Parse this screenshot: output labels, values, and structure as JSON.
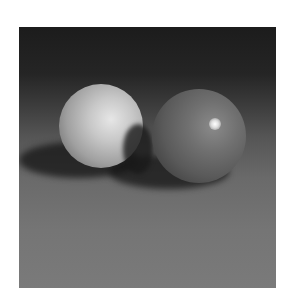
{
  "image": {
    "description": "Rendered scene of two spheres resting on a plane, casting shadows",
    "type": "grayscale rendering",
    "objects": [
      {
        "name": "left-sphere",
        "shade": "light gray",
        "matte": true
      },
      {
        "name": "right-sphere",
        "shade": "medium gray",
        "specular_highlight": true
      }
    ],
    "colors": {
      "background_top": "#1c1c1c",
      "floor": "#757575",
      "left_sphere": "#c8c8c8",
      "right_sphere": "#6a6a6a",
      "highlight": "#ffffff",
      "page_background": "#ffffff"
    }
  }
}
